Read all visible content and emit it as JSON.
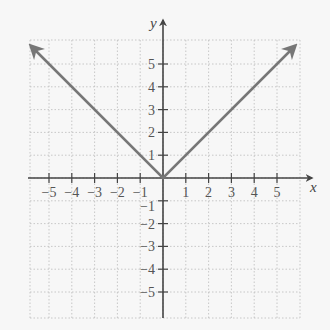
{
  "chart_data": {
    "type": "line",
    "title": "",
    "function": "y = |x|",
    "xlabel": "x",
    "ylabel": "y",
    "xlim": [
      -6,
      6
    ],
    "ylim": [
      -6,
      6
    ],
    "grid": true,
    "grid_style": "dotted",
    "x_ticks": [
      -5,
      -4,
      -3,
      -2,
      -1,
      1,
      2,
      3,
      4,
      5
    ],
    "y_ticks": [
      -5,
      -4,
      -3,
      -2,
      -1,
      1,
      2,
      3,
      4,
      5
    ],
    "x_tick_labels": [
      "−5",
      "−4",
      "−3",
      "−2",
      "−1",
      "1",
      "2",
      "3",
      "4",
      "5"
    ],
    "y_tick_labels": [
      "−5",
      "−4",
      "−3",
      "−2",
      "−1",
      "1",
      "2",
      "3",
      "4",
      "5"
    ],
    "series": [
      {
        "name": "y = |x|",
        "points": [
          [
            -5.8,
            5.8
          ],
          [
            0,
            0
          ],
          [
            5.8,
            5.8
          ]
        ],
        "arrows_at_ends": true,
        "color": "#777777"
      }
    ],
    "legend": null
  },
  "colors": {
    "background": "#f7f7f7",
    "axis": "#444444",
    "grid": "#bbbbbb",
    "line": "#777777"
  }
}
